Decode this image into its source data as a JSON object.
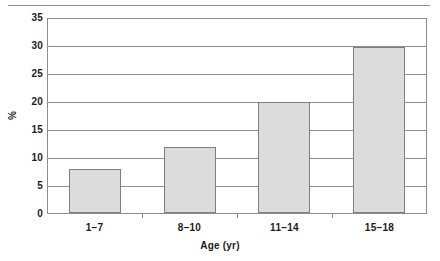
{
  "chart_data": {
    "type": "bar",
    "title": "",
    "subtitle": "",
    "categories": [
      "1–7",
      "8–10",
      "11–14",
      "15–18"
    ],
    "values": [
      8,
      12,
      20,
      30
    ],
    "xlabel": "Age (yr)",
    "ylabel": "%",
    "ylim": [
      0,
      35
    ],
    "yticks": [
      0,
      5,
      10,
      15,
      20,
      25,
      30,
      35
    ],
    "ytick_labels": [
      "0",
      "5",
      "10",
      "15",
      "20",
      "25",
      "30",
      "35"
    ],
    "grid": "horizontal",
    "legend": "none",
    "series": [
      {
        "name": "percent",
        "values": [
          8,
          12,
          20,
          30
        ]
      }
    ],
    "annotations": [],
    "colors": {
      "bar_fill": "#dcdcdc",
      "bar_border": "#7f7f7f",
      "axis": "#8d8d8d",
      "gridline": "#8d8d8d",
      "text": "#1b1b1b",
      "background": "#ffffff",
      "top_rule": "#8d8d8d"
    }
  },
  "figure": {
    "top_rule_name": "top-divider-rule"
  }
}
